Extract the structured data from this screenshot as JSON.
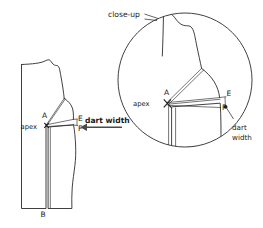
{
  "figure": {
    "title_visible": false,
    "background_color": "#ffffff",
    "line_color": "#2b2b2b",
    "type": "sewing-pattern-dart-diagram"
  },
  "labels": {
    "closeup": "close-up",
    "apex_main": "apex",
    "apex_closeup": "apex",
    "point_a_main": "A",
    "point_a_closeup": "A",
    "point_b_main": "B",
    "point_e_main": "E",
    "point_f_main": "F",
    "point_e_closeup": "E",
    "point_f_closeup": "F",
    "dart_width_main": "dart width",
    "dart_width_closeup_line1": "dart",
    "dart_width_closeup_line2": "width"
  },
  "annotations": {
    "arrow_direction": "left",
    "arrow_target": "dart-opening-between-E-and-F",
    "closeup_leader_target": "magnifier-circle"
  },
  "geometry": {
    "main_piece": {
      "description": "bodice front pattern block with shoulder dart rotated to waist/side position",
      "bottom_label_point": "B"
    },
    "magnifier": {
      "center_x": 185,
      "center_y": 80,
      "radius": 67
    }
  }
}
